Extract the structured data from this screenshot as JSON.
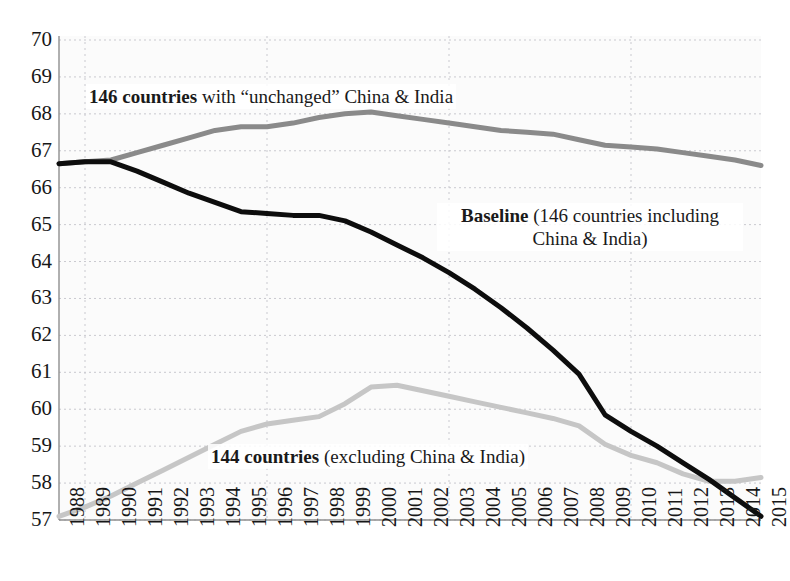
{
  "clipped_title": "",
  "chart_data": {
    "type": "line",
    "title": "",
    "xlabel": "",
    "ylabel": "",
    "xlim": [
      1988,
      2015
    ],
    "ylim": [
      57,
      70
    ],
    "yticks": [
      70,
      69,
      68,
      67,
      66,
      65,
      64,
      63,
      62,
      61,
      60,
      59,
      58,
      57
    ],
    "xticks": [
      1988,
      1989,
      1990,
      1991,
      1992,
      1993,
      1994,
      1995,
      1996,
      1997,
      1998,
      1999,
      2000,
      2001,
      2002,
      2003,
      2004,
      2005,
      2006,
      2007,
      2008,
      2009,
      2010,
      2011,
      2012,
      2013,
      2014,
      2015
    ],
    "grid": true,
    "legend_position": "in-plot annotations",
    "x": [
      1988,
      1989,
      1990,
      1991,
      1992,
      1993,
      1994,
      1995,
      1996,
      1997,
      1998,
      1999,
      2000,
      2001,
      2002,
      2003,
      2004,
      2005,
      2006,
      2007,
      2008,
      2009,
      2010,
      2011,
      2012,
      2013,
      2014,
      2015
    ],
    "series": [
      {
        "name": "146 countries with \"unchanged\" China & India",
        "color": "#8a8a8a",
        "width": 5,
        "values": [
          66.65,
          66.7,
          66.75,
          66.95,
          67.15,
          67.35,
          67.55,
          67.65,
          67.65,
          67.75,
          67.9,
          68.0,
          68.05,
          67.95,
          67.85,
          67.75,
          67.65,
          67.55,
          67.5,
          67.45,
          67.3,
          67.15,
          67.1,
          67.05,
          66.95,
          66.85,
          66.75,
          66.6
        ]
      },
      {
        "name": "Baseline (146 countries including China & India)",
        "color": "#0d0d0d",
        "width": 5,
        "values": [
          66.65,
          66.7,
          66.7,
          66.45,
          66.15,
          65.85,
          65.6,
          65.35,
          65.3,
          65.25,
          65.25,
          65.1,
          64.8,
          64.45,
          64.1,
          63.7,
          63.25,
          62.75,
          62.2,
          61.6,
          60.95,
          59.85,
          59.4,
          59.0,
          58.55,
          58.1,
          57.6,
          57.1
        ]
      },
      {
        "name": "144 countries (excluding China & India)",
        "color": "#c6c6c6",
        "width": 5,
        "values": [
          57.1,
          57.35,
          57.65,
          58.0,
          58.35,
          58.7,
          59.05,
          59.4,
          59.6,
          59.7,
          59.8,
          60.15,
          60.6,
          60.65,
          60.5,
          60.35,
          60.2,
          60.05,
          59.9,
          59.75,
          59.55,
          59.05,
          58.75,
          58.55,
          58.25,
          58.05,
          58.05,
          58.15
        ]
      }
    ],
    "annotations": [
      {
        "name": "annotation-unchanged",
        "bold": "146 countries",
        "rest": " with “unchanged” China & India"
      },
      {
        "name": "annotation-baseline",
        "bold": "Baseline",
        "rest": " (146 countries including China & India)"
      },
      {
        "name": "annotation-excluding",
        "bold": "144 countries",
        "rest": " (excluding China & India)"
      }
    ]
  },
  "colors": {
    "gridline": "#c9c9cf",
    "axis": "#8f8f8f",
    "plot_background": "#fbfbfb",
    "series_unchanged": "#8a8a8a",
    "series_baseline": "#0d0d0d",
    "series_excluding": "#c6c6c6"
  }
}
